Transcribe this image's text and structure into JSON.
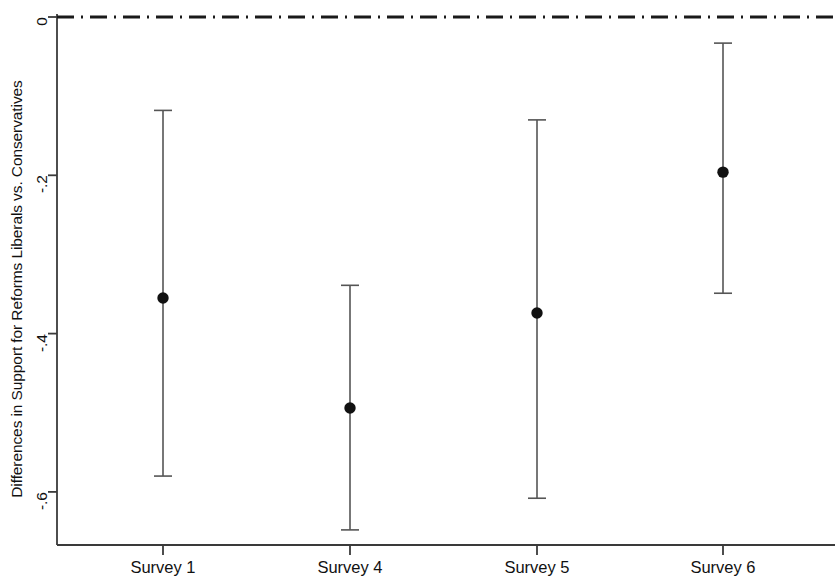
{
  "chart_data": {
    "type": "scatter",
    "title": "",
    "subtitle": "",
    "xlabel": "",
    "ylabel": "Differences in Support for Reforms Liberals vs. Conservatives",
    "categories": [
      "Survey 1",
      "Survey 4",
      "Survey 5",
      "Survey 6"
    ],
    "values": [
      -0.355,
      -0.494,
      -0.374,
      -0.196
    ],
    "error_low": [
      -0.58,
      -0.648,
      -0.608,
      -0.349
    ],
    "error_high": [
      -0.118,
      -0.339,
      -0.13,
      -0.033
    ],
    "series": [
      {
        "name": "Differences in Support for Reforms Liberals vs. Conservatives",
        "values": [
          -0.355,
          -0.494,
          -0.374,
          -0.196
        ],
        "ci_lower": [
          -0.58,
          -0.648,
          -0.608,
          -0.349
        ],
        "ci_upper": [
          -0.118,
          -0.339,
          -0.13,
          -0.033
        ]
      }
    ],
    "points": [
      {
        "category": "Survey 1",
        "estimate": -0.355,
        "ci_lower": -0.58,
        "ci_upper": -0.118
      },
      {
        "category": "Survey 4",
        "estimate": -0.494,
        "ci_lower": -0.648,
        "ci_upper": -0.339
      },
      {
        "category": "Survey 5",
        "estimate": -0.374,
        "ci_lower": -0.608,
        "ci_upper": -0.13
      },
      {
        "category": "Survey 6",
        "estimate": -0.196,
        "ci_lower": -0.349,
        "ci_upper": -0.033
      }
    ],
    "yticks": [
      0,
      -0.2,
      -0.4,
      -0.6
    ],
    "ytick_labels": [
      "0",
      "-.2",
      "-.4",
      "-.6"
    ],
    "xtick_labels": [
      "Survey 1",
      "Survey 4",
      "Survey 5",
      "Survey 6"
    ],
    "ylim": [
      -0.68,
      0.02
    ],
    "xlim": [
      0.5,
      4.5
    ],
    "grid": false,
    "legend": null,
    "legend_position": "none",
    "reference_line": {
      "value": 0,
      "style": "dash-dot",
      "color": "#1a1a1a"
    },
    "marker": {
      "shape": "circle",
      "color": "#111111",
      "size": 9
    },
    "line_color": "#555555",
    "axis_color": "#3a3a3a",
    "background": "#ffffff"
  },
  "axis": {
    "y_title": "Differences in Support for Reforms Liberals vs. Conservatives",
    "y_labels": [
      "0",
      "-.2",
      "-.4",
      "-.6"
    ],
    "x_labels": [
      "Survey 1",
      "Survey 4",
      "Survey 5",
      "Survey 6"
    ]
  }
}
